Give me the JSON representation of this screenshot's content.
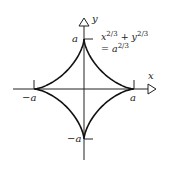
{
  "diagram": {
    "equation_line1": "x",
    "equation_exp1": "2/3",
    "equation_plus": " + y",
    "equation_exp2": "2/3",
    "equation_line2": "= a",
    "equation_exp3": "2/3",
    "axes": {
      "x_label": "x",
      "y_label": "y"
    },
    "ticks": {
      "x_pos": "a",
      "x_neg": "−a",
      "y_pos": "a",
      "y_neg": "−a"
    },
    "colors": {
      "curve": "#111111",
      "axis": "#222222",
      "background": "#ffffff"
    }
  }
}
